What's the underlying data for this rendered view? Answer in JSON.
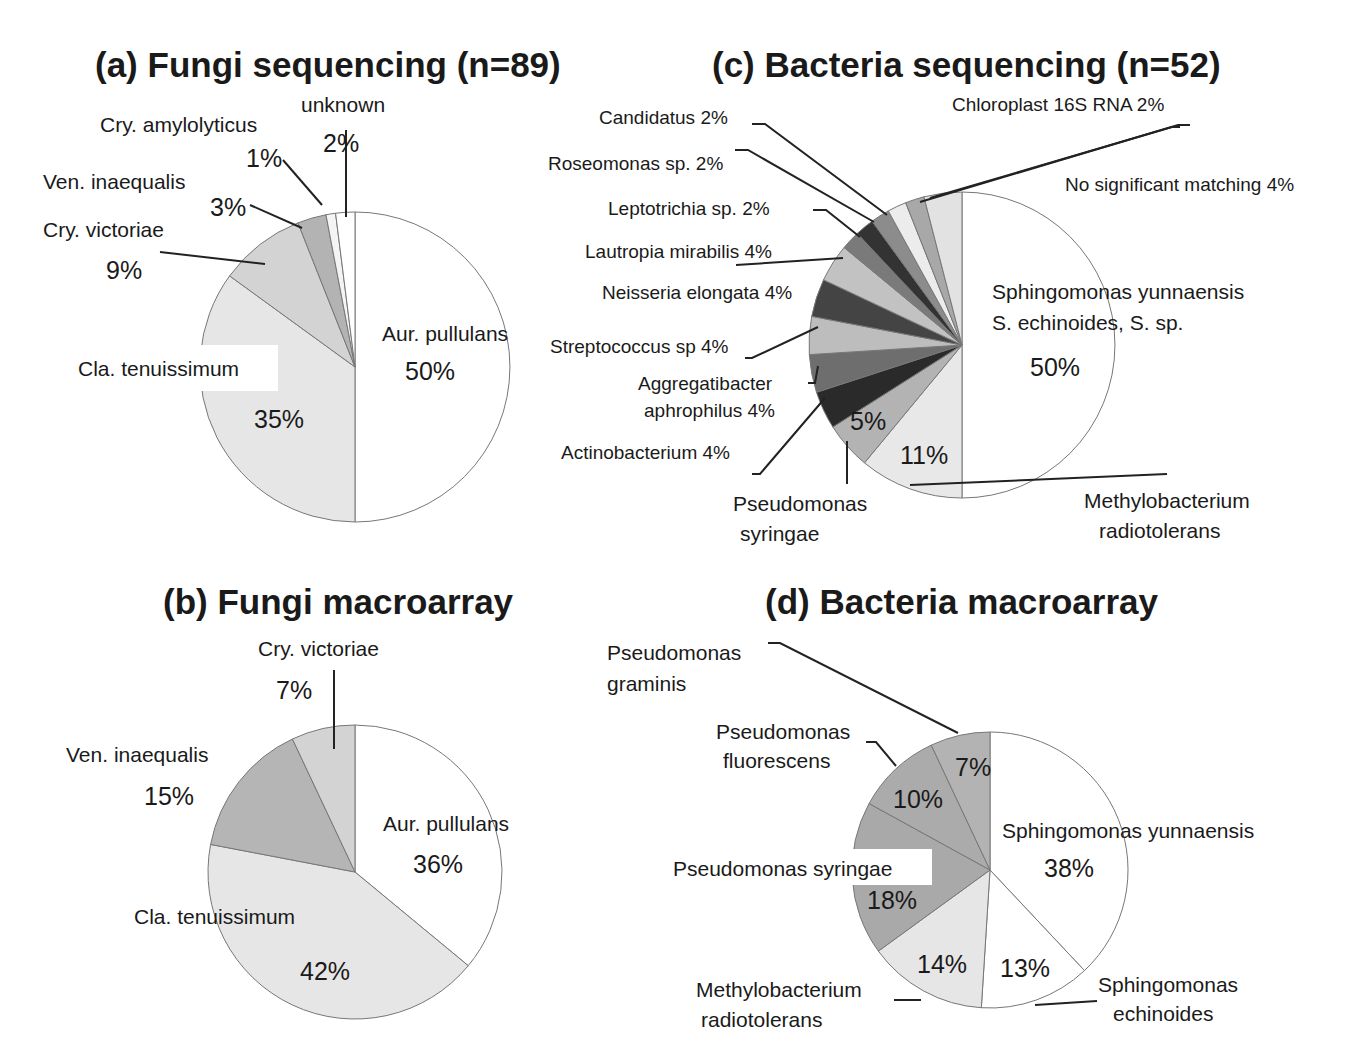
{
  "chart_data": [
    {
      "id": "a",
      "type": "pie",
      "title": "(a)  Fungi sequencing (n=89)",
      "center": [
        355,
        367
      ],
      "radius": 155,
      "slices": [
        {
          "label": "Aur. pullulans",
          "value": 50,
          "pct_label": "50%",
          "color": "#ffffff"
        },
        {
          "label": "Cla. tenuissimum",
          "value": 35,
          "pct_label": "35%",
          "color": "#e6e6e6"
        },
        {
          "label": "Cry. victoriae",
          "value": 9,
          "pct_label": "9%",
          "color": "#d3d3d3"
        },
        {
          "label": "Ven. inaequalis",
          "value": 3,
          "pct_label": "3%",
          "color": "#b3b3b3"
        },
        {
          "label": "Cry. amylolyticus",
          "value": 1,
          "pct_label": "1%",
          "color": "#f4f4f4"
        },
        {
          "label": "unknown",
          "value": 2,
          "pct_label": "2%",
          "color": "#ffffff"
        }
      ]
    },
    {
      "id": "b",
      "type": "pie",
      "title": "(b)  Fungi macroarray",
      "center": [
        355,
        872
      ],
      "radius": 147,
      "slices": [
        {
          "label": "Aur. pullulans",
          "value": 36,
          "pct_label": "36%",
          "color": "#ffffff"
        },
        {
          "label": "Cla. tenuissimum",
          "value": 42,
          "pct_label": "42%",
          "color": "#e6e6e6"
        },
        {
          "label": "Ven. inaequalis",
          "value": 15,
          "pct_label": "15%",
          "color": "#b5b5b5"
        },
        {
          "label": "Cry. victoriae",
          "value": 7,
          "pct_label": "7%",
          "color": "#d3d3d3"
        }
      ]
    },
    {
      "id": "c",
      "type": "pie",
      "title": "(c)  Bacteria sequencing (n=52)",
      "center": [
        962,
        345
      ],
      "radius": 153,
      "slices": [
        {
          "label": "Sphingomonas yunnaensis S. echinoides, S. sp.",
          "value": 50,
          "pct_label": "50%",
          "color": "#ffffff"
        },
        {
          "label": "Methylobacterium radiotolerans",
          "value": 11,
          "pct_label": "11%",
          "color": "#e8e8e8"
        },
        {
          "label": "Pseudomonas syringae",
          "value": 5,
          "pct_label": "5%",
          "color": "#b3b3b3"
        },
        {
          "label": "Actinobacterium",
          "value": 4,
          "pct_label": "4%",
          "color": "#2a2a2a"
        },
        {
          "label": "Aggregatibacter aphrophilus",
          "value": 4,
          "pct_label": "4%",
          "color": "#6e6e6e"
        },
        {
          "label": "Streptococcus sp",
          "value": 4,
          "pct_label": "4%",
          "color": "#bdbdbd"
        },
        {
          "label": "Neisseria elongata",
          "value": 4,
          "pct_label": "4%",
          "color": "#444444"
        },
        {
          "label": "Lautropia mirabilis",
          "value": 4,
          "pct_label": "4%",
          "color": "#c2c2c2"
        },
        {
          "label": "Leptotrichia sp.",
          "value": 2,
          "pct_label": "2%",
          "color": "#7a7a7a"
        },
        {
          "label": "Roseomonas sp.",
          "value": 2,
          "pct_label": "2%",
          "color": "#333333"
        },
        {
          "label": "Candidatus",
          "value": 2,
          "pct_label": "2%",
          "color": "#8c8c8c"
        },
        {
          "label": "Chloroplast 16S RNA",
          "value": 2,
          "pct_label": "2%",
          "color": "#ececec"
        },
        {
          "label": "No significant matching",
          "value": 2,
          "pct_label": "2%",
          "color": "#a8a8a8"
        },
        {
          "label": "No significant matching (cont.)",
          "value": 4,
          "pct_label": "4%",
          "color": "#e2e2e2"
        }
      ]
    },
    {
      "id": "d",
      "type": "pie",
      "title": "(d)  Bacteria macroarray",
      "center": [
        990,
        870
      ],
      "radius": 138,
      "slices": [
        {
          "label": "Sphingomonas yunnaensis",
          "value": 38,
          "pct_label": "38%",
          "color": "#ffffff"
        },
        {
          "label": "Sphingomonas echinoides",
          "value": 13,
          "pct_label": "13%",
          "color": "#ffffff"
        },
        {
          "label": "Methylobacterium radiotolerans",
          "value": 14,
          "pct_label": "14%",
          "color": "#e6e6e6"
        },
        {
          "label": "Pseudomonas syringae",
          "value": 18,
          "pct_label": "18%",
          "color": "#a9a9a9"
        },
        {
          "label": "Pseudomonas fluorescens",
          "value": 10,
          "pct_label": "10%",
          "color": "#ababab"
        },
        {
          "label": "Pseudomonas graminis",
          "value": 7,
          "pct_label": "7%",
          "color": "#b3b3b3"
        }
      ]
    }
  ],
  "panels": {
    "a": {
      "title": "(a)  Fungi sequencing (n=89)",
      "labels": {
        "unknown": "unknown",
        "unknown_pct": "2%",
        "amylolyticus": "Cry. amylolyticus",
        "amylolyticus_pct": "1%",
        "inaequalis": "Ven. inaequalis",
        "inaequalis_pct": "3%",
        "victoriae": "Cry. victoriae",
        "victoriae_pct": "9%",
        "tenuissimum": "Cla. tenuissimum",
        "tenuissimum_pct": "35%",
        "pullulans": "Aur. pullulans",
        "pullulans_pct": "50%"
      }
    },
    "b": {
      "title": "(b)  Fungi macroarray",
      "labels": {
        "victoriae": "Cry. victoriae",
        "victoriae_pct": "7%",
        "inaequalis": "Ven. inaequalis",
        "inaequalis_pct": "15%",
        "pullulans": "Aur. pullulans",
        "pullulans_pct": "36%",
        "tenuissimum": "Cla. tenuissimum",
        "tenuissimum_pct": "42%"
      }
    },
    "c": {
      "title": "(c)  Bacteria sequencing (n=52)",
      "labels": {
        "candidatus": "Candidatus 2%",
        "chloroplast": "Chloroplast 16S RNA 2%",
        "roseomonas": "Roseomonas sp.  2%",
        "nosig": "No significant matching 4%",
        "leptotrichia": "Leptotrichia sp.  2%",
        "lautropia": "Lautropia mirabilis  4%",
        "neisseria": "Neisseria elongata 4%",
        "sphingo_1": "Sphingomonas yunnaensis",
        "sphingo_2": "S. echinoides, S. sp.",
        "sphingo_pct": "50%",
        "streptococcus": "Streptococcus sp  4%",
        "aggregati_1": "Aggregatibacter",
        "aggregati_2": "aphrophilus  4%",
        "actino": "Actinobacterium  4%",
        "pseudo_pct": "5%",
        "methylo_pct": "11%",
        "pseudo_1": "Pseudomonas",
        "pseudo_2": "syringae",
        "methylo_1": "Methylobacterium",
        "methylo_2": "radiotolerans"
      }
    },
    "d": {
      "title": "(d)  Bacteria macroarray",
      "labels": {
        "graminis_1": "Pseudomonas",
        "graminis_2": "graminis",
        "fluor_1": "Pseudomonas",
        "fluor_2": "fluorescens",
        "graminis_pct": "7%",
        "fluor_pct": "10%",
        "yunn": "Sphingomonas yunnaensis",
        "yunn_pct": "38%",
        "syringae": "Pseudomonas syringae",
        "syringae_pct": "18%",
        "methylo_pct": "14%",
        "echin_pct": "13%",
        "methylo_1": "Methylobacterium",
        "methylo_2": "radiotolerans",
        "echin_1": "Sphingomonas",
        "echin_2": "echinoides"
      }
    }
  }
}
